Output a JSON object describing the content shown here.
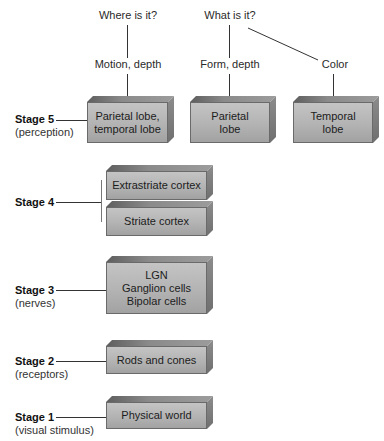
{
  "top_labels": {
    "where": "Where is it?",
    "what": "What is it?"
  },
  "mid_labels": {
    "motion": "Motion, depth",
    "form": "Form, depth",
    "color": "Color"
  },
  "stages": [
    {
      "name": "Stage 5",
      "sub": "(perception)"
    },
    {
      "name": "Stage 4",
      "sub": ""
    },
    {
      "name": "Stage 3",
      "sub": "(nerves)"
    },
    {
      "name": "Stage 2",
      "sub": "(receptors)"
    },
    {
      "name": "Stage 1",
      "sub": "(visual stimulus)"
    }
  ],
  "boxes": {
    "parietal_temporal": [
      "Parietal lobe,",
      "temporal lobe"
    ],
    "parietal": [
      "Parietal",
      "lobe"
    ],
    "temporal": [
      "Temporal",
      "lobe"
    ],
    "extrastriate": "Extrastriate cortex",
    "striate": "Striate cortex",
    "nerves": [
      "LGN",
      "Ganglion cells",
      "Bipolar cells"
    ],
    "receptors": "Rods and cones",
    "stimulus": "Physical world"
  },
  "colors": {
    "box_front": "#b3b3b3",
    "box_top": "#7a7a7a",
    "line": "#333333"
  }
}
